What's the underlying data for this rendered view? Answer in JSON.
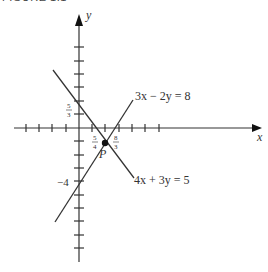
{
  "figure": {
    "caption": "FIGURE 1.1",
    "axes": {
      "x_label": "x",
      "y_label": "y"
    },
    "lines": [
      {
        "equation": "3x − 2y = 8",
        "name": "line-3x-minus-2y-eq-8"
      },
      {
        "equation": "4x + 3y = 5",
        "name": "line-4x-plus-3y-eq-5"
      }
    ],
    "intersection_point": {
      "label": "P"
    },
    "annotations": {
      "y_intercept_1": {
        "num": "5",
        "den": "3"
      },
      "y_intercept_2": "−4",
      "x_intercept_1": {
        "num": "5",
        "den": "4"
      },
      "x_intercept_2": {
        "num": "8",
        "den": "3"
      }
    },
    "colors": {
      "ink": "#333333",
      "background": "#ffffff"
    }
  }
}
